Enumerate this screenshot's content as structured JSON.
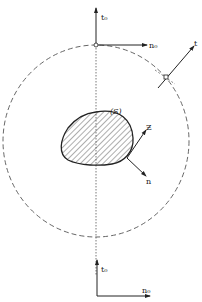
{
  "diagram": {
    "region_label": "(S)",
    "top_axes": {
      "vertical_label": "t₀",
      "horizontal_label": "n₀"
    },
    "surface_point_vector_label": "t",
    "normal_label": "n",
    "tangent_label": "Ƶ",
    "bottom_axes": {
      "vertical_label": "t₀",
      "horizontal_label": "n₀"
    },
    "colors": {
      "stroke": "#222222",
      "dashed": "#555555",
      "background": "#ffffff"
    }
  }
}
